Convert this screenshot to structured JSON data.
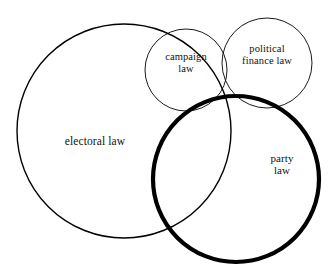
{
  "diagram": {
    "type": "venn",
    "title": "",
    "background_color": "#ffffff",
    "stroke_color": "#000000",
    "width": 332,
    "height": 267,
    "sets": [
      {
        "id": "electoral-law",
        "label": "electoral law",
        "cx": 124,
        "cy": 131,
        "r": 107,
        "stroke_width": 1.4,
        "emphasis": "normal",
        "label_x": 40,
        "label_y": 135
      },
      {
        "id": "campaign-law",
        "label": "campaign\nlaw",
        "cx": 186,
        "cy": 70,
        "r": 41,
        "stroke_width": 0.9,
        "emphasis": "normal",
        "label_x": 146,
        "label_y": 51
      },
      {
        "id": "political-finance-law",
        "label": "political\nfinance law",
        "cx": 267,
        "cy": 63,
        "r": 45,
        "stroke_width": 0.9,
        "emphasis": "normal",
        "label_x": 222,
        "label_y": 43
      },
      {
        "id": "party-law",
        "label": "party\nlaw",
        "cx": 236,
        "cy": 179,
        "r": 83,
        "stroke_width": 4.2,
        "emphasis": "bold",
        "label_x": 252,
        "label_y": 152
      }
    ]
  }
}
